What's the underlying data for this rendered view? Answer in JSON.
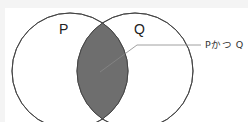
{
  "diagram": {
    "type": "venn",
    "sets": [
      {
        "id": "P",
        "label": "P"
      },
      {
        "id": "Q",
        "label": "Q"
      }
    ],
    "intersection": {
      "label": "Pかつ Q",
      "fill": "#6e6e6e"
    },
    "colors": {
      "stroke": "#555555",
      "circle_fill": "#ffffff",
      "leader_line": "#888888"
    }
  }
}
